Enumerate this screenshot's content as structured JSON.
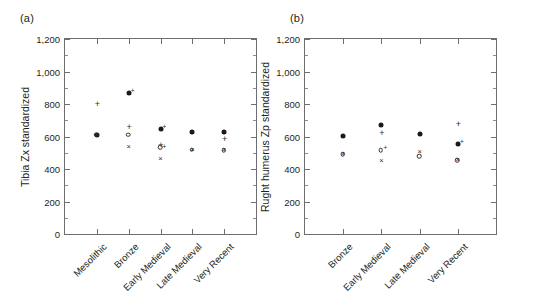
{
  "figure": {
    "panel_a_label": "(a)",
    "panel_b_label": "(b)"
  },
  "chart_data": [
    {
      "type": "scatter",
      "panel": "(a)",
      "title": "",
      "xlabel": "",
      "ylabel": "Tibia Zx standardized",
      "ylim": [
        0,
        1200
      ],
      "yticks": [
        0,
        200,
        400,
        600,
        800,
        1000,
        1200
      ],
      "ytick_labels": [
        "0",
        "200",
        "400",
        "600",
        "800",
        "1,000",
        "1,200"
      ],
      "grid": false,
      "legend": "none",
      "categories": [
        "Mesolithic",
        "Bronze",
        "Early Medieval",
        "Late Medieval",
        "Very Recent"
      ],
      "series": [
        {
          "name": "filled-circle",
          "marker": "filled-circle",
          "values": [
            610,
            865,
            645,
            625,
            625
          ]
        },
        {
          "name": "plus",
          "marker": "plus",
          "values": [
            798,
            660,
            548,
            null,
            585
          ]
        },
        {
          "name": "open-circle",
          "marker": "open-circle",
          "values": [
            610,
            610,
            535,
            520,
            515
          ]
        },
        {
          "name": "cross",
          "marker": "cross",
          "values": [
            608,
            535,
            460,
            520,
            515
          ]
        }
      ]
    },
    {
      "type": "scatter",
      "panel": "(b)",
      "title": "",
      "xlabel": "",
      "ylabel": "Rught humerus Zp standardized",
      "ylim": [
        0,
        1200
      ],
      "yticks": [
        0,
        200,
        400,
        600,
        800,
        1000,
        1200
      ],
      "ytick_labels": [
        "0",
        "200",
        "400",
        "600",
        "800",
        "1,000",
        "1,200"
      ],
      "grid": false,
      "legend": "none",
      "categories": [
        "Bronze",
        "Early Medieval",
        "Late Medieval",
        "Very Recent"
      ],
      "series": [
        {
          "name": "filled-circle",
          "marker": "filled-circle",
          "values": [
            605,
            670,
            615,
            555
          ]
        },
        {
          "name": "plus",
          "marker": "plus",
          "values": [
            null,
            620,
            null,
            680
          ]
        },
        {
          "name": "open-circle",
          "marker": "open-circle",
          "values": [
            492,
            515,
            480,
            455
          ]
        },
        {
          "name": "cross",
          "marker": "cross",
          "values": [
            490,
            450,
            505,
            458
          ]
        }
      ]
    }
  ]
}
